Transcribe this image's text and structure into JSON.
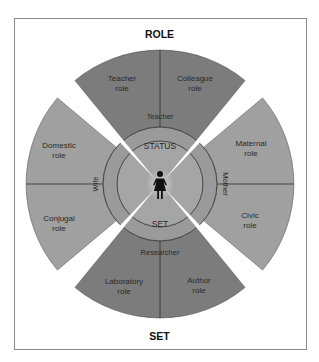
{
  "diagram": {
    "top_label": "ROLE",
    "bottom_label": "SET",
    "center": {
      "status_label": "STATUS",
      "set_label": "SET",
      "figure_icon": "woman-figure-icon"
    },
    "statuses": [
      {
        "label": "Teacher",
        "position": "top"
      },
      {
        "label": "Mother",
        "position": "right"
      },
      {
        "label": "Researcher",
        "position": "bottom"
      },
      {
        "label": "Wife",
        "position": "left"
      }
    ],
    "roles": [
      {
        "label_line1": "Teacher",
        "label_line2": "role",
        "status": "Teacher"
      },
      {
        "label_line1": "Colleague",
        "label_line2": "role",
        "status": "Teacher"
      },
      {
        "label_line1": "Maternal",
        "label_line2": "role",
        "status": "Mother"
      },
      {
        "label_line1": "Civic",
        "label_line2": "role",
        "status": "Mother"
      },
      {
        "label_line1": "Author",
        "label_line2": "role",
        "status": "Researcher"
      },
      {
        "label_line1": "Laboratory",
        "label_line2": "role",
        "status": "Researcher"
      },
      {
        "label_line1": "Conjugal",
        "label_line2": "role",
        "status": "Wife"
      },
      {
        "label_line1": "Domestic",
        "label_line2": "role",
        "status": "Wife"
      }
    ],
    "colors": {
      "dark_sector": "#7a7a7a",
      "light_sector": "#a3a3a3",
      "status_ring": "#9c9c9c",
      "center_disc": "#a6a6a6",
      "figure_halo": "#c4c4c4",
      "outline": "#3a3a3a"
    }
  }
}
